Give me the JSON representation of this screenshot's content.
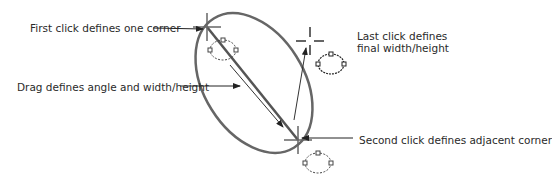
{
  "diagram": {
    "labels": {
      "first_click": "First click defines one corner",
      "drag": "Drag defines angle and width/height",
      "last_click_line1": "Last click defines",
      "last_click_line2": "final width/height",
      "second_click": "Second click defines adjacent corner"
    },
    "colors": {
      "ellipse_stroke": "#666666",
      "line": "#333333",
      "text": "#2a2a2a",
      "background": "#ffffff"
    },
    "icons": [
      "crosshair-cursor",
      "ellipse-cursor-icon"
    ]
  }
}
